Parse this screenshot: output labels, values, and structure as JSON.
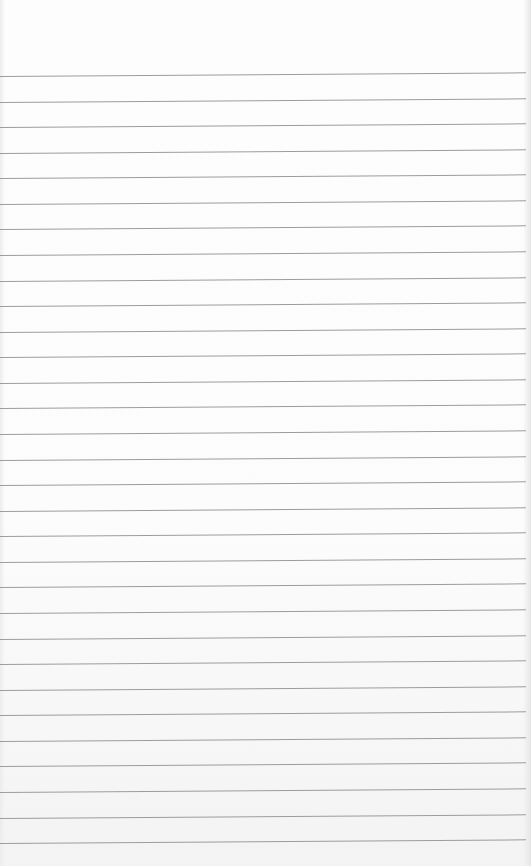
{
  "paper": {
    "type": "lined-paper",
    "background_color": "#fcfcfc",
    "rule_color": "#9c9c9c",
    "rule_count": 31,
    "first_rule_y": 76,
    "rule_spacing": 25.57,
    "tilt_deg": -0.4
  }
}
